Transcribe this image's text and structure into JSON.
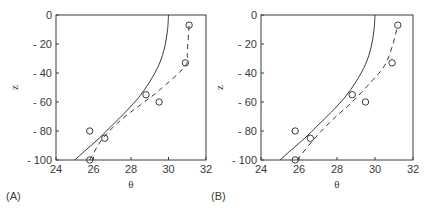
{
  "chart_data": [
    {
      "panel": "(A)",
      "type": "line",
      "xlabel": "θ",
      "ylabel": "z",
      "xlim": [
        24,
        32
      ],
      "ylim": [
        -100,
        0
      ],
      "xticks": [
        24,
        26,
        28,
        30,
        32
      ],
      "yticks": [
        0,
        -20,
        -40,
        -60,
        -80,
        -100
      ],
      "xtick_labels": [
        "24",
        "26",
        "28",
        "30",
        "32"
      ],
      "ytick_labels": [
        "0",
        "- 20",
        "- 40",
        "- 60",
        "- 80",
        "- 100"
      ],
      "grid": false,
      "legend": null,
      "series": [
        {
          "name": "solid-curve",
          "style": "solid",
          "points": [
            [
              25.0,
              -100
            ],
            [
              25.6,
              -93
            ],
            [
              26.3,
              -85
            ],
            [
              27.0,
              -76
            ],
            [
              27.7,
              -67
            ],
            [
              28.4,
              -57
            ],
            [
              29.0,
              -46
            ],
            [
              29.5,
              -34
            ],
            [
              29.8,
              -22
            ],
            [
              29.95,
              -10
            ],
            [
              30.0,
              0
            ]
          ]
        },
        {
          "name": "dashed-curve",
          "style": "dashed",
          "points": [
            [
              25.8,
              -100
            ],
            [
              26.5,
              -85
            ],
            [
              27.5,
              -72
            ],
            [
              28.5,
              -62
            ],
            [
              29.5,
              -52
            ],
            [
              30.9,
              -35
            ],
            [
              31.0,
              -25
            ],
            [
              31.1,
              -7
            ]
          ]
        },
        {
          "name": "observations",
          "style": "markers",
          "marker": "open-circle",
          "points": [
            [
              31.1,
              -7
            ],
            [
              30.9,
              -33
            ],
            [
              28.8,
              -55
            ],
            [
              29.5,
              -60
            ],
            [
              25.8,
              -80
            ],
            [
              26.6,
              -85
            ],
            [
              25.8,
              -100
            ]
          ]
        }
      ]
    },
    {
      "panel": "(B)",
      "type": "line",
      "xlabel": "θ",
      "ylabel": "z",
      "xlim": [
        24,
        32
      ],
      "ylim": [
        -100,
        0
      ],
      "xticks": [
        24,
        26,
        28,
        30,
        32
      ],
      "yticks": [
        0,
        -20,
        -40,
        -60,
        -80,
        -100
      ],
      "xtick_labels": [
        "24",
        "26",
        "28",
        "30",
        "32"
      ],
      "ytick_labels": [
        "0",
        "- 20",
        "- 40",
        "- 60",
        "- 80",
        "- 100"
      ],
      "grid": false,
      "legend": null,
      "series": [
        {
          "name": "solid-curve",
          "style": "solid",
          "points": [
            [
              25.0,
              -100
            ],
            [
              25.6,
              -93
            ],
            [
              26.3,
              -85
            ],
            [
              27.0,
              -76
            ],
            [
              27.7,
              -67
            ],
            [
              28.4,
              -57
            ],
            [
              29.0,
              -46
            ],
            [
              29.5,
              -34
            ],
            [
              29.8,
              -22
            ],
            [
              29.95,
              -10
            ],
            [
              30.0,
              0
            ]
          ]
        },
        {
          "name": "dashed-curve",
          "style": "dashed",
          "points": [
            [
              25.9,
              -100
            ],
            [
              26.7,
              -87
            ],
            [
              27.7,
              -73
            ],
            [
              28.8,
              -60
            ],
            [
              29.8,
              -46
            ],
            [
              30.5,
              -35
            ],
            [
              30.9,
              -22
            ],
            [
              31.2,
              -7
            ]
          ]
        },
        {
          "name": "observations",
          "style": "markers",
          "marker": "open-circle",
          "points": [
            [
              31.2,
              -7
            ],
            [
              30.9,
              -33
            ],
            [
              28.8,
              -55
            ],
            [
              29.5,
              -60
            ],
            [
              25.8,
              -80
            ],
            [
              26.6,
              -85
            ],
            [
              25.8,
              -100
            ]
          ]
        }
      ]
    }
  ],
  "panels": [
    {
      "label": "(A)",
      "frame": {
        "x0": 56,
        "x1": 206,
        "y0": 15,
        "y1": 160
      }
    },
    {
      "label": "(B)",
      "frame": {
        "x0": 261,
        "x1": 413,
        "y0": 15,
        "y1": 160
      }
    }
  ],
  "colors": {
    "ink": "#3a3a3a",
    "background": "#ffffff"
  }
}
